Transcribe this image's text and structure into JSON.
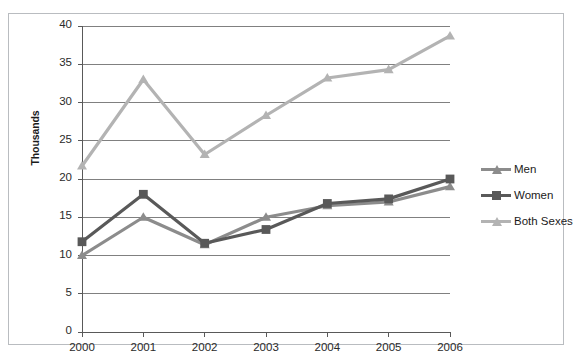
{
  "chart_data": {
    "type": "line",
    "title": "",
    "subtitle": "",
    "xlabel": "",
    "ylabel": "Thousands",
    "categories": [
      "2000",
      "2001",
      "2002",
      "2003",
      "2004",
      "2005",
      "2006"
    ],
    "x": [
      2000,
      2001,
      2002,
      2003,
      2004,
      2005,
      2006
    ],
    "ylim": [
      0,
      40
    ],
    "yticks": [
      0,
      5,
      10,
      15,
      20,
      25,
      30,
      35,
      40
    ],
    "ytick_labels": [
      "0",
      "5",
      "10",
      "15",
      "20",
      "25",
      "30",
      "35",
      "40"
    ],
    "grid": "horizontal",
    "legend_position": "right",
    "series": [
      {
        "name": "Men",
        "color": "#8c8c8c",
        "marker": "triangle",
        "values": [
          10.0,
          15.0,
          11.4,
          15.0,
          16.5,
          17.0,
          19.0
        ]
      },
      {
        "name": "Women",
        "color": "#595959",
        "marker": "square",
        "values": [
          11.8,
          18.0,
          11.6,
          13.4,
          16.8,
          17.4,
          20.0
        ]
      },
      {
        "name": "Both Sexes",
        "color": "#b3b3b3",
        "marker": "triangle",
        "values": [
          21.7,
          33.0,
          23.2,
          28.3,
          33.2,
          34.3,
          38.7
        ]
      }
    ]
  },
  "legend": {
    "items": [
      {
        "label": "Men"
      },
      {
        "label": "Women"
      },
      {
        "label": "Both Sexes"
      }
    ]
  },
  "colors": {
    "men": "#8c8c8c",
    "women": "#595959",
    "both_sexes": "#b3b3b3",
    "gridline": "#808080",
    "axis": "#595959",
    "frame": "#b9bcc0",
    "text": "#2a2a2a"
  }
}
